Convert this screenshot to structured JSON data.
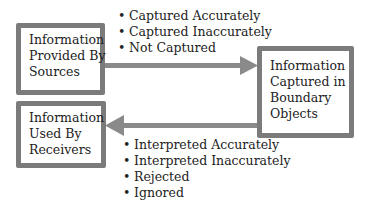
{
  "boxes": {
    "sources": {
      "lines": [
        "Information",
        "Provided By",
        "Sources"
      ]
    },
    "boundary": {
      "lines": [
        "Information",
        "Captured in",
        "Boundary",
        "Objects"
      ]
    },
    "receivers": {
      "lines": [
        "Information",
        "Used By",
        "Receivers"
      ]
    }
  },
  "capture_outcomes": [
    "Captured Accurately",
    "Captured Inaccurately",
    "Not Captured"
  ],
  "interpretation_outcomes": [
    "Interpreted Accurately",
    "Interpreted Inaccurately",
    "Rejected",
    "Ignored"
  ],
  "colors": {
    "border": "#7b7b7b",
    "arrow": "#8a8a8a",
    "text": "#222222"
  }
}
